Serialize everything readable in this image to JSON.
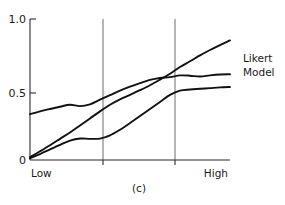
{
  "figure": {
    "caption": "(c)",
    "annotation_line1": "Likert",
    "annotation_line2": "Model"
  },
  "axes": {
    "y_ticks": [
      "1.0",
      "0.5",
      "0"
    ],
    "x_low_label": "Low",
    "x_high_label": "High"
  },
  "chart_data": {
    "type": "line",
    "title": "",
    "subtitle": "",
    "xlabel": "",
    "ylabel": "",
    "caption": "(c)",
    "xlim": [
      0,
      1
    ],
    "ylim": [
      0,
      1
    ],
    "y_ticks": [
      0,
      0.5,
      1.0
    ],
    "y_tick_labels": [
      "0",
      "0.5",
      "1.0"
    ],
    "x_tick_labels": [
      "Low",
      "High"
    ],
    "x_tick_positions": [
      0,
      1
    ],
    "grid": false,
    "reference_lines": {
      "orientation": "vertical",
      "x_values": [
        0.365,
        0.725
      ],
      "color": "#6e6e6e"
    },
    "legend": {
      "position": "right-outside",
      "entries": [
        "Likert Model"
      ]
    },
    "annotations": [
      {
        "text": "Likert Model",
        "x": 1.07,
        "y": 0.72,
        "target_series": "likert-model"
      }
    ],
    "series": [
      {
        "name": "upper-concave-curve",
        "id": "curve-upper",
        "color": "#111111",
        "x": [
          0.0,
          0.05,
          0.1,
          0.15,
          0.2,
          0.25,
          0.3,
          0.35,
          0.4,
          0.45,
          0.5,
          0.55,
          0.6,
          0.65,
          0.7,
          0.75,
          0.8,
          0.85,
          0.9,
          0.95,
          1.0
        ],
        "y": [
          0.325,
          0.345,
          0.362,
          0.378,
          0.392,
          0.382,
          0.395,
          0.428,
          0.46,
          0.492,
          0.52,
          0.545,
          0.568,
          0.582,
          0.588,
          0.6,
          0.598,
          0.592,
          0.6,
          0.606,
          0.608
        ]
      },
      {
        "name": "likert-model",
        "id": "curve-likert",
        "color": "#111111",
        "x": [
          0.0,
          0.05,
          0.1,
          0.15,
          0.2,
          0.25,
          0.3,
          0.35,
          0.4,
          0.45,
          0.5,
          0.55,
          0.6,
          0.65,
          0.7,
          0.75,
          0.8,
          0.85,
          0.9,
          0.95,
          1.0
        ],
        "y": [
          0.02,
          0.062,
          0.105,
          0.15,
          0.195,
          0.245,
          0.295,
          0.345,
          0.392,
          0.43,
          0.462,
          0.495,
          0.53,
          0.57,
          0.612,
          0.66,
          0.7,
          0.742,
          0.78,
          0.815,
          0.848
        ]
      },
      {
        "name": "lower-sigmoid-curve",
        "id": "curve-lower",
        "color": "#111111",
        "x": [
          0.0,
          0.05,
          0.1,
          0.15,
          0.2,
          0.25,
          0.3,
          0.35,
          0.4,
          0.45,
          0.5,
          0.55,
          0.6,
          0.65,
          0.7,
          0.75,
          0.8,
          0.85,
          0.9,
          0.95,
          1.0
        ],
        "y": [
          0.012,
          0.042,
          0.075,
          0.108,
          0.138,
          0.152,
          0.15,
          0.152,
          0.175,
          0.215,
          0.262,
          0.312,
          0.362,
          0.412,
          0.462,
          0.492,
          0.5,
          0.505,
          0.51,
          0.515,
          0.518
        ]
      }
    ]
  }
}
